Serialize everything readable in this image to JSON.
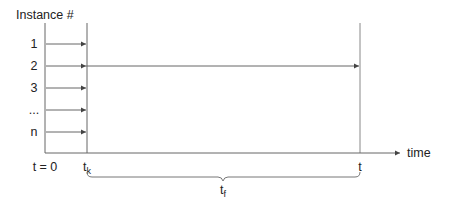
{
  "diagram": {
    "y_axis_title": "Instance #",
    "rows": [
      {
        "label": "1",
        "ends_at": "t_k"
      },
      {
        "label": "2",
        "ends_at": "t"
      },
      {
        "label": "3",
        "ends_at": "t_k"
      },
      {
        "label": "...",
        "ends_at": "t_k"
      },
      {
        "label": "n",
        "ends_at": "t_k"
      }
    ],
    "x_axis": {
      "label": "time",
      "ticks": {
        "origin": "t = 0",
        "tk_base": "t",
        "tk_sub": "k",
        "t": "t"
      }
    },
    "brace": {
      "base": "t",
      "sub": "f"
    },
    "colors": {
      "line": "#555555",
      "text": "#222222"
    }
  }
}
